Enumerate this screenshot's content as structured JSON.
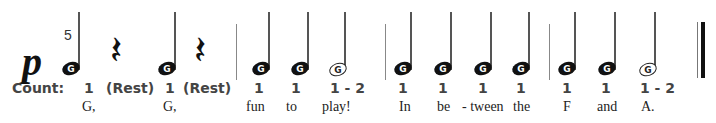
{
  "dynamic": "p",
  "fingering": "5",
  "count_label": "Count:",
  "notes": [
    {
      "letter": "G",
      "type": "quarter",
      "count": "1",
      "lyric": "G,"
    },
    {
      "type": "rest",
      "count": "(Rest)"
    },
    {
      "letter": "G",
      "type": "quarter",
      "count": "1",
      "lyric": "G,"
    },
    {
      "type": "rest",
      "count": "(Rest)"
    },
    {
      "letter": "G",
      "type": "quarter",
      "count": "1",
      "lyric": "fun"
    },
    {
      "letter": "G",
      "type": "quarter",
      "count": "1",
      "lyric": "to"
    },
    {
      "letter": "G",
      "type": "half",
      "count": "1 - 2",
      "lyric": "play!"
    },
    {
      "letter": "G",
      "type": "quarter",
      "count": "1",
      "lyric": "In"
    },
    {
      "letter": "G",
      "type": "quarter",
      "count": "1",
      "lyric": "be"
    },
    {
      "letter": "G",
      "type": "quarter",
      "count": "1",
      "lyric": "- tween"
    },
    {
      "letter": "G",
      "type": "quarter",
      "count": "1",
      "lyric": "the"
    },
    {
      "letter": "G",
      "type": "quarter",
      "count": "1",
      "lyric": "F"
    },
    {
      "letter": "G",
      "type": "quarter",
      "count": "1",
      "lyric": "and"
    },
    {
      "letter": "G",
      "type": "half",
      "count": "1 - 2",
      "lyric": "A."
    }
  ],
  "rest_glyph": "𝄽"
}
